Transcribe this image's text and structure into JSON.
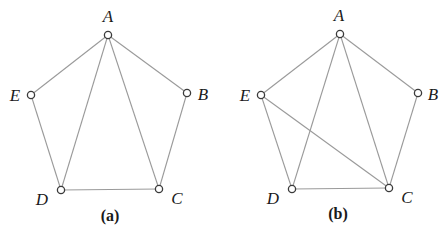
{
  "colors": {
    "edge": "#9a9a9a",
    "node_stroke": "#3a3a3a",
    "node_fill": "#ffffff",
    "text": "#1a1a1a"
  },
  "graphs": [
    {
      "caption": "(a)",
      "caption_pos": [
        110,
        221
      ],
      "vertices": [
        {
          "id": "A",
          "label": "A",
          "x": 108,
          "y": 35,
          "lx": 108,
          "ly": 22
        },
        {
          "id": "B",
          "label": "B",
          "x": 187,
          "y": 93,
          "lx": 203,
          "ly": 100
        },
        {
          "id": "C",
          "label": "C",
          "x": 159,
          "y": 189,
          "lx": 177,
          "ly": 204
        },
        {
          "id": "D",
          "label": "D",
          "x": 61,
          "y": 190,
          "lx": 42,
          "ly": 205
        },
        {
          "id": "E",
          "label": "E",
          "x": 31,
          "y": 95,
          "lx": 15,
          "ly": 101
        }
      ],
      "edges": [
        [
          "A",
          "B"
        ],
        [
          "A",
          "E"
        ],
        [
          "A",
          "D"
        ],
        [
          "A",
          "C"
        ],
        [
          "B",
          "C"
        ],
        [
          "C",
          "D"
        ],
        [
          "D",
          "E"
        ]
      ]
    },
    {
      "caption": "(b)",
      "caption_pos": [
        338,
        219
      ],
      "vertices": [
        {
          "id": "A",
          "label": "A",
          "x": 340,
          "y": 34,
          "lx": 339,
          "ly": 21
        },
        {
          "id": "B",
          "label": "B",
          "x": 418,
          "y": 93,
          "lx": 433,
          "ly": 100
        },
        {
          "id": "C",
          "label": "C",
          "x": 389,
          "y": 188,
          "lx": 407,
          "ly": 203
        },
        {
          "id": "D",
          "label": "D",
          "x": 292,
          "y": 189,
          "lx": 273,
          "ly": 204
        },
        {
          "id": "E",
          "label": "E",
          "x": 261,
          "y": 95,
          "lx": 245,
          "ly": 101
        }
      ],
      "edges": [
        [
          "A",
          "B"
        ],
        [
          "A",
          "E"
        ],
        [
          "A",
          "D"
        ],
        [
          "A",
          "C"
        ],
        [
          "B",
          "C"
        ],
        [
          "C",
          "D"
        ],
        [
          "D",
          "E"
        ],
        [
          "E",
          "C"
        ]
      ]
    }
  ]
}
